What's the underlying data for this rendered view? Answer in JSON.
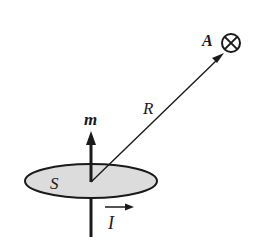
{
  "diagram": {
    "labels": {
      "area": "S",
      "moment": "m",
      "radius": "R",
      "point": "A",
      "current": "I"
    },
    "colors": {
      "stroke": "#1a1a1a",
      "loop_fill": "#dcdcdc",
      "background": "#ffffff"
    },
    "elements": {
      "loop": {
        "cx": 91,
        "cy": 181,
        "rx": 66,
        "ry": 17
      },
      "moment_vector": {
        "from": [
          91,
          182
        ],
        "to": [
          91,
          131
        ]
      },
      "radius_vector": {
        "from": [
          91,
          182
        ],
        "to": [
          224,
          53
        ]
      },
      "point_symbol": {
        "type": "into-page (circle-cross)",
        "cx": 231,
        "cy": 43,
        "r": 9
      },
      "current_arrow": {
        "from": [
          105,
          207
        ],
        "to": [
          134,
          207
        ]
      },
      "axis_below": {
        "from": [
          91,
          199
        ],
        "to": [
          91,
          237
        ]
      }
    }
  }
}
